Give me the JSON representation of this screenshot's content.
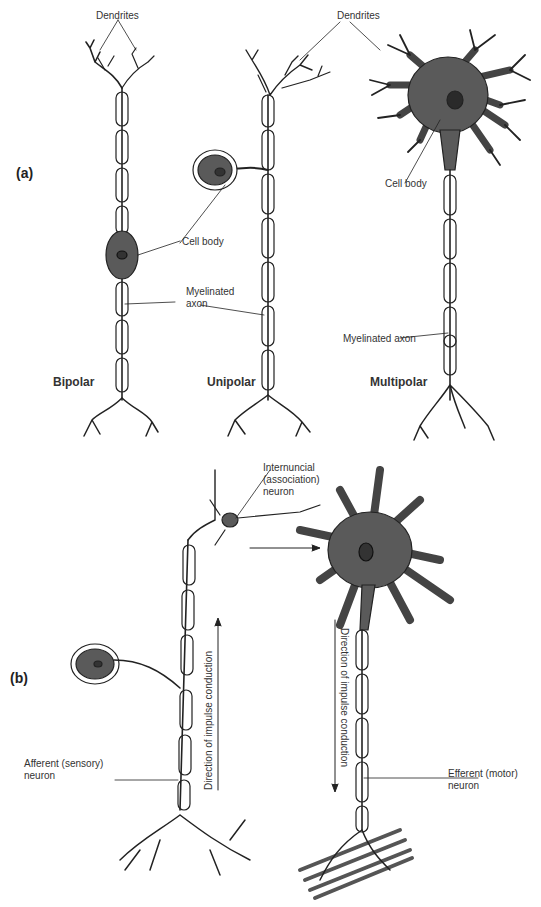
{
  "panel_a": {
    "label": "(a)",
    "labels": {
      "dendrites_left": "Dendrites",
      "dendrites_right": "Dendrites",
      "cell_body_bipolar": "Cell body",
      "cell_body_multipolar": "Cell body",
      "myelinated_axon_line1": "Myelinated",
      "myelinated_axon_line2": "axon",
      "myelinated_axon_multipolar": "Myelinated axon"
    },
    "neuron_types": [
      "Bipolar",
      "Unipolar",
      "Multipolar"
    ]
  },
  "panel_b": {
    "label": "(b)",
    "labels": {
      "internuncial_line1": "Internuncial",
      "internuncial_line2": "(association)",
      "internuncial_line3": "neuron",
      "afferent_line1": "Afferent (sensory)",
      "afferent_line2": "neuron",
      "efferent_line1": "Efferent (motor)",
      "efferent_line2": "neuron",
      "direction_up": "Direction of impulse conduction",
      "direction_down": "Direction of impulse conduction"
    }
  },
  "colors": {
    "cell_body_fill": "#5a5a5a",
    "line": "#222222",
    "background": "#ffffff"
  }
}
